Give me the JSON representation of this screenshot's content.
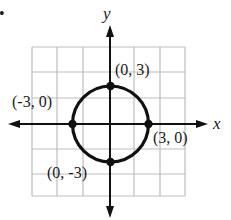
{
  "figure": {
    "bullet": "•",
    "axes": {
      "x_label": "x",
      "y_label": "y"
    },
    "grid": {
      "x_lines": [
        32,
        57,
        83,
        110,
        134,
        160,
        185
      ],
      "y_lines": [
        47,
        72,
        98,
        124,
        149,
        174,
        196
      ],
      "color": "#bdbdbd"
    },
    "circle": {
      "equation": "x^2 + y^2 = 9",
      "center": [
        0,
        0
      ],
      "radius": 3
    },
    "points": [
      {
        "label": "(0, 3)",
        "x": 0,
        "y": 3
      },
      {
        "label": "(-3, 0)",
        "x": -3,
        "y": 0
      },
      {
        "label": "(3, 0)",
        "x": 3,
        "y": 0
      },
      {
        "label": "(0, -3)",
        "x": 0,
        "y": -3
      }
    ],
    "colors": {
      "ink": "#111111",
      "grid": "#bdbdbd",
      "background": "#ffffff"
    }
  }
}
